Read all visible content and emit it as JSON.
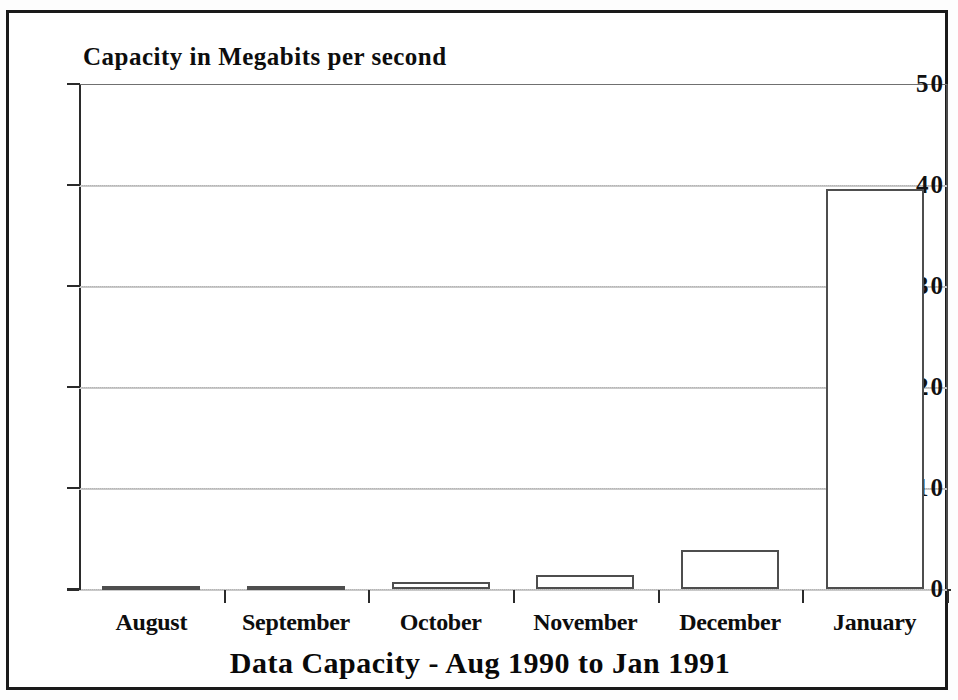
{
  "chart_data": {
    "type": "bar",
    "title": "Data Capacity - Aug 1990 to Jan 1991",
    "ylabel": "Capacity in Megabits per second",
    "xlabel": "",
    "categories": [
      "August",
      "September",
      "October",
      "November",
      "December",
      "January"
    ],
    "values": [
      0.2,
      0.3,
      0.7,
      1.4,
      3.9,
      39.6
    ],
    "ylim": [
      0,
      50
    ],
    "yticks": [
      0,
      10,
      20,
      30,
      40,
      50
    ],
    "ytick_labels": [
      "0",
      "10",
      "20",
      "30",
      "40",
      "50"
    ],
    "grid": true,
    "grid_axis": "y",
    "legend": null,
    "series": [
      {
        "name": "Capacity",
        "values": [
          0.2,
          0.3,
          0.7,
          1.4,
          3.9,
          39.6
        ]
      }
    ],
    "colors": {
      "bar_fill": "#ffffff",
      "bar_edge": "#4e4e4e",
      "axis": "#2b2b2b",
      "grid": "#c9c9c9",
      "text": "#0d0d0d",
      "frame": "#1a1a1a"
    }
  }
}
